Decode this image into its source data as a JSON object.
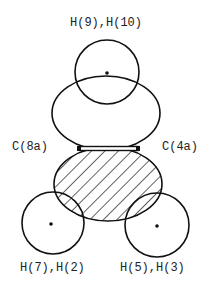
{
  "diagram": {
    "type": "molecular orbital / electron density sketch",
    "colors": {
      "stroke": "#111111",
      "background": "#ffffff",
      "label": "#222222"
    },
    "labels": {
      "top": "H(9),H(10)",
      "left_carbon": "C(8a)",
      "right_carbon": "C(4a)",
      "bottom_left": "H(7),H(2)",
      "bottom_right": "H(5),H(3)"
    },
    "shapes": [
      {
        "name": "top-hydrogen-circle",
        "kind": "circle",
        "cx": 107,
        "cy": 72,
        "r": 32,
        "has_nucleus_dot": true
      },
      {
        "name": "upper-lobe",
        "kind": "ellipse",
        "cx": 106,
        "cy": 113,
        "rx": 54,
        "ry": 37,
        "hatched": false
      },
      {
        "name": "lower-lobe",
        "kind": "ellipse",
        "cx": 108,
        "cy": 184,
        "rx": 54,
        "ry": 37,
        "hatched": true
      },
      {
        "name": "bottom-left-hydrogen-circle",
        "kind": "circle",
        "cx": 53,
        "cy": 223,
        "r": 31,
        "has_nucleus_dot": true
      },
      {
        "name": "bottom-right-hydrogen-circle",
        "kind": "circle",
        "cx": 157,
        "cy": 225,
        "r": 32,
        "has_nucleus_dot": true
      },
      {
        "name": "c8a-c4a-bond",
        "kind": "bond",
        "x1": 79,
        "x2": 138,
        "y": 149
      }
    ]
  }
}
